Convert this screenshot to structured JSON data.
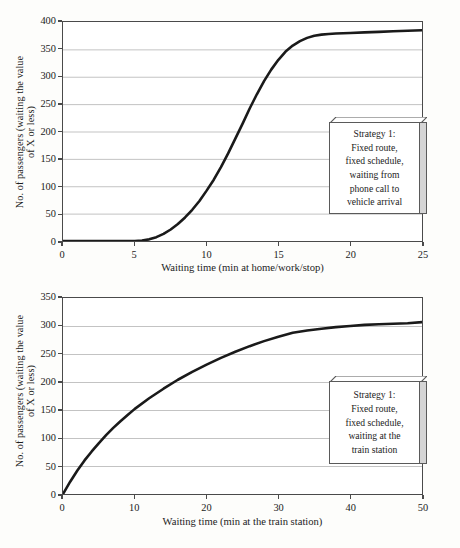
{
  "background_color": "#fdfdfb",
  "axis_color": "#4a4a4a",
  "grid_color": "#c3c3c3",
  "curve_color": "#1a1a1a",
  "charts": [
    {
      "id": "top",
      "ylabel_line1": "No. of passengers (waiting the value",
      "ylabel_line2": "of X or less)",
      "xlabel": "Waiting time (min at home/work/stop)",
      "yticks": [
        "0",
        "50",
        "100",
        "150",
        "200",
        "250",
        "300",
        "350",
        "400"
      ],
      "xticks": [
        "0",
        "5",
        "10",
        "15",
        "20",
        "25"
      ],
      "callout": {
        "lines": [
          "Strategy 1:",
          "Fixed route,",
          "fixed schedule,",
          "waiting from",
          "phone call to",
          "vehicle arrival"
        ]
      }
    },
    {
      "id": "bottom",
      "ylabel_line1": "No. of passengers (waiting the value",
      "ylabel_line2": "of X or less)",
      "xlabel": "Waiting time (min at the train station)",
      "yticks": [
        "0",
        "50",
        "100",
        "150",
        "200",
        "250",
        "300",
        "350"
      ],
      "xticks": [
        "0",
        "10",
        "20",
        "30",
        "40",
        "50"
      ],
      "callout": {
        "lines": [
          "Strategy 1:",
          "Fixed route,",
          "fixed schedule,",
          "waiting at the",
          "train station"
        ]
      }
    }
  ],
  "chart_data": [
    {
      "type": "line",
      "title": "",
      "xlabel": "Waiting time (min at home/work/stop)",
      "ylabel": "No. of passengers (waiting the value of X or less)",
      "xlim": [
        0,
        25
      ],
      "ylim": [
        0,
        400
      ],
      "xticks": [
        0,
        5,
        10,
        15,
        20,
        25
      ],
      "yticks": [
        0,
        50,
        100,
        150,
        200,
        250,
        300,
        350,
        400
      ],
      "grid": "horizontal",
      "legend": "none",
      "annotation": "Strategy 1: Fixed route, fixed schedule, waiting from phone call to vehicle arrival",
      "series": [
        {
          "name": "Cumulative passengers",
          "x": [
            0,
            1,
            2,
            3,
            4,
            5,
            5.5,
            6,
            6.5,
            7,
            7.5,
            8,
            8.5,
            9,
            9.5,
            10,
            10.5,
            11,
            11.5,
            12,
            12.5,
            13,
            13.5,
            14,
            14.5,
            15,
            15.5,
            16,
            16.5,
            17,
            17.5,
            18,
            18.5,
            19,
            19.5,
            20,
            21,
            22,
            23,
            24,
            25
          ],
          "y": [
            0,
            0,
            0,
            0,
            0,
            0,
            1,
            3,
            7,
            13,
            21,
            31,
            43,
            57,
            73,
            92,
            112,
            135,
            160,
            187,
            214,
            242,
            268,
            292,
            313,
            331,
            346,
            357,
            365,
            371,
            375,
            377,
            378,
            379,
            379.5,
            380,
            381,
            382,
            383,
            384,
            385
          ]
        }
      ]
    },
    {
      "type": "line",
      "title": "",
      "xlabel": "Waiting time (min at the train station)",
      "ylabel": "No. of passengers (waiting the value of X or less)",
      "xlim": [
        0,
        50
      ],
      "ylim": [
        0,
        350
      ],
      "xticks": [
        0,
        10,
        20,
        30,
        40,
        50
      ],
      "yticks": [
        0,
        50,
        100,
        150,
        200,
        250,
        300,
        350
      ],
      "grid": "horizontal",
      "legend": "none",
      "annotation": "Strategy 1: Fixed route, fixed schedule, waiting at the train station",
      "series": [
        {
          "name": "Cumulative passengers",
          "x": [
            0,
            1,
            2,
            3,
            4,
            5,
            6,
            7,
            8,
            9,
            10,
            12,
            14,
            16,
            18,
            20,
            22,
            24,
            26,
            28,
            30,
            32,
            34,
            36,
            38,
            40,
            42,
            44,
            46,
            48,
            50
          ],
          "y": [
            0,
            22,
            42,
            60,
            76,
            91,
            105,
            118,
            130,
            141,
            152,
            171,
            188,
            204,
            218,
            231,
            243,
            254,
            264,
            273,
            281,
            288,
            292,
            295,
            298,
            300,
            302,
            303,
            304,
            305,
            307
          ]
        }
      ]
    }
  ]
}
